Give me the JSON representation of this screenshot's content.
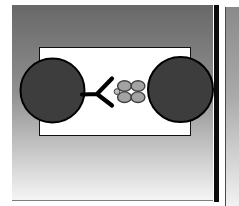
{
  "slide": {
    "gradient_top": "#686868",
    "gradient_mid": "#909090",
    "gradient_bottom": "#f5f5f5",
    "bottom_edge_color": "#7e7e7e",
    "shadow_color": "#0b0b0b"
  },
  "next_slide": {
    "gradient_top": "#8a8a8a",
    "gradient_mid": "#aaaaaa",
    "gradient_bottom": "#f2f2f2",
    "edge_color": "#4a4a4a"
  },
  "panel": {
    "background": "#ffffff",
    "border_color": "#101010"
  },
  "diagram": {
    "shapes": [
      {
        "name": "cell-left",
        "type": "circle",
        "attrs": {
          "cx": 52.5,
          "cy": 90.5,
          "r": 32,
          "fill": "#3d3d3d",
          "stroke": "#000000",
          "stroke-width": 2
        }
      },
      {
        "name": "cell-right",
        "type": "circle",
        "attrs": {
          "cx": 180.5,
          "cy": 89.5,
          "r": 32.5,
          "fill": "#3d3d3d",
          "stroke": "#000000",
          "stroke-width": 2
        }
      },
      {
        "name": "antibody-y-icon",
        "type": "path",
        "attrs": {
          "d": "M82 94.5 L97 94 L112 78.5 M97 94 L112 105.5",
          "fill": "none",
          "stroke": "#000000",
          "stroke-width": 4.2,
          "stroke-linecap": "round",
          "stroke-linejoin": "round"
        }
      },
      {
        "name": "tetramer-subunit-top-left",
        "type": "ellipse",
        "attrs": {
          "cx": 124.5,
          "cy": 86,
          "rx": 6.9,
          "ry": 5.3,
          "fill": "#a3a3a3",
          "stroke": "#3f3f3f",
          "stroke-width": 1.4
        }
      },
      {
        "name": "tetramer-subunit-top-right",
        "type": "ellipse",
        "attrs": {
          "cx": 138,
          "cy": 86,
          "rx": 6.9,
          "ry": 5.3,
          "fill": "#a3a3a3",
          "stroke": "#3f3f3f",
          "stroke-width": 1.4
        }
      },
      {
        "name": "tetramer-subunit-bottom-left",
        "type": "ellipse",
        "attrs": {
          "cx": 124.5,
          "cy": 97.2,
          "rx": 6.9,
          "ry": 5.3,
          "fill": "#a3a3a3",
          "stroke": "#3f3f3f",
          "stroke-width": 1.4
        }
      },
      {
        "name": "tetramer-subunit-bottom-right",
        "type": "ellipse",
        "attrs": {
          "cx": 138,
          "cy": 97.2,
          "rx": 6.9,
          "ry": 5.3,
          "fill": "#a3a3a3",
          "stroke": "#3f3f3f",
          "stroke-width": 1.4
        }
      },
      {
        "name": "ligand-dot",
        "type": "circle",
        "attrs": {
          "cx": 117,
          "cy": 91.6,
          "r": 2.9,
          "fill": "#bdbdbd",
          "stroke": "#3f3f3f",
          "stroke-width": 1
        }
      }
    ]
  }
}
